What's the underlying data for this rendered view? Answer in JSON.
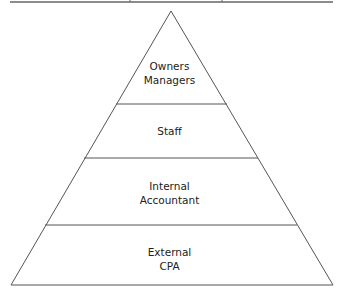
{
  "diagram": {
    "type": "pyramid",
    "colors": {
      "stroke": "#555555",
      "text": "#222222",
      "background": "#ffffff"
    },
    "levels": [
      {
        "lines": [
          "Owners",
          "Managers"
        ]
      },
      {
        "lines": [
          "Staff"
        ]
      },
      {
        "lines": [
          "Internal",
          "Accountant"
        ]
      },
      {
        "lines": [
          "External",
          "CPA"
        ]
      }
    ]
  }
}
